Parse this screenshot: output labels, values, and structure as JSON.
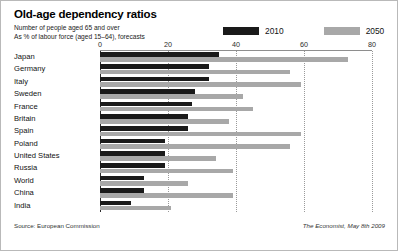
{
  "header": {
    "title": "Old-age dependency ratios",
    "subtitle_line1": "Number of people aged 65 and over",
    "subtitle_line2": "As % of labour force (aged 15–64), forecasts"
  },
  "legend": {
    "items": [
      {
        "label": "2010",
        "color": "#1a1a1a"
      },
      {
        "label": "2050",
        "color": "#a8a8a8"
      }
    ]
  },
  "footer": {
    "source": "Source: European Commission",
    "brand": "The Economist, May 8th 2009"
  },
  "chart_data": {
    "type": "bar",
    "orientation": "horizontal",
    "title": "Old-age dependency ratios",
    "subtitle": "Number of people aged 65 and over. As % of labour force (aged 15–64), forecasts",
    "xlabel": "",
    "ylabel": "",
    "xlim": [
      0,
      80
    ],
    "xticks": [
      0,
      20,
      40,
      60,
      80
    ],
    "xtick_labels": [
      "0",
      "20",
      "40",
      "60",
      "80"
    ],
    "grid": true,
    "grid_axis": "x",
    "legend_position": "top-right",
    "categories": [
      "Japan",
      "Germany",
      "Italy",
      "Sweden",
      "France",
      "Britain",
      "Spain",
      "Poland",
      "United States",
      "Russia",
      "World",
      "China",
      "India"
    ],
    "series": [
      {
        "name": "2010",
        "color": "#1a1a1a",
        "values": [
          35,
          32,
          32,
          28,
          27,
          26,
          26,
          19,
          19,
          19,
          13,
          13,
          9
        ]
      },
      {
        "name": "2050",
        "color": "#a8a8a8",
        "values": [
          73,
          56,
          59,
          42,
          45,
          38,
          59,
          56,
          34,
          39,
          26,
          39,
          21
        ]
      }
    ]
  }
}
